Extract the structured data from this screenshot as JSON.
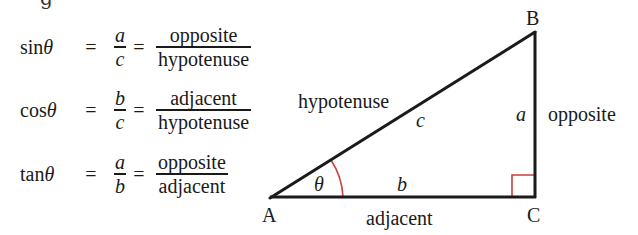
{
  "heading_partial": "g",
  "formulas": [
    {
      "fn": "sin",
      "var": "θ",
      "eq1": "=",
      "ratio_num": "a",
      "ratio_den": "c",
      "eq2": "=",
      "word_num": "opposite",
      "word_den": "hypotenuse"
    },
    {
      "fn": "cos",
      "var": "θ",
      "eq1": "=",
      "ratio_num": "b",
      "ratio_den": "c",
      "eq2": "=",
      "word_num": "adjacent",
      "word_den": "hypotenuse"
    },
    {
      "fn": "tan",
      "var": "θ",
      "eq1": "=",
      "ratio_num": "a",
      "ratio_den": "b",
      "eq2": "=",
      "word_num": "opposite",
      "word_den": "adjacent"
    }
  ],
  "triangle": {
    "vertices": {
      "A": "A",
      "B": "B",
      "C": "C"
    },
    "sides": {
      "a": "a",
      "b": "b",
      "c": "c"
    },
    "side_names": {
      "hypotenuse": "hypotenuse",
      "opposite": "opposite",
      "adjacent": "adjacent"
    },
    "angle": "θ",
    "colors": {
      "line": "#1a1a1a",
      "angle_marker": "#c8433a"
    }
  }
}
